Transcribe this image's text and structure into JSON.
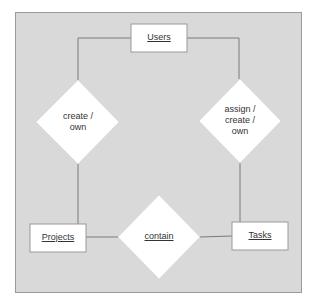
{
  "entities": [
    {
      "id": "users",
      "label": "Users"
    },
    {
      "id": "projects",
      "label": "Projects"
    },
    {
      "id": "tasks",
      "label": "Tasks"
    }
  ],
  "relationships": [
    {
      "id": "create_own",
      "label_lines": [
        "create /",
        "own"
      ],
      "connects": [
        "users",
        "projects"
      ]
    },
    {
      "id": "assign_create_own",
      "label_lines": [
        "assign /",
        "create /",
        "own"
      ],
      "connects": [
        "users",
        "tasks"
      ]
    },
    {
      "id": "contain",
      "label": "contain",
      "connects": [
        "projects",
        "tasks"
      ]
    }
  ],
  "colors": {
    "background": "#d9d9d9",
    "shape_fill": "#ffffff",
    "line": "#7a7a7a",
    "border": "#9a9a9a"
  }
}
